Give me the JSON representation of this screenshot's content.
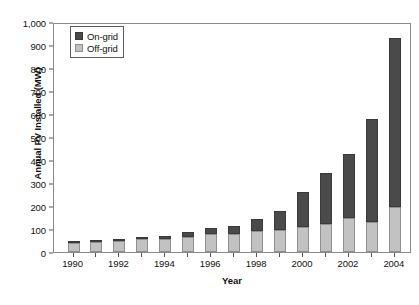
{
  "chart_data": {
    "type": "bar",
    "stacked": true,
    "title": "",
    "xlabel": "Year",
    "ylabel": "Annual PV Installed (MW)",
    "categories": [
      "1990",
      "1991",
      "1992",
      "1993",
      "1994",
      "1995",
      "1996",
      "1997",
      "1998",
      "1999",
      "2000",
      "2001",
      "2002",
      "2003",
      "2004"
    ],
    "x_tick_labels": [
      "1990",
      "1992",
      "1994",
      "1996",
      "1998",
      "2000",
      "2002",
      "2004"
    ],
    "y_tick_labels": [
      "0",
      "100",
      "200",
      "300",
      "400",
      "500",
      "600",
      "700",
      "800",
      "900",
      "1,000"
    ],
    "y_tick_values": [
      0,
      100,
      200,
      300,
      400,
      500,
      600,
      700,
      800,
      900,
      1000
    ],
    "ylim": [
      0,
      1000
    ],
    "grid": false,
    "legend_position": "top-left",
    "series": [
      {
        "name": "Off-grid",
        "color": "#c2c2c2",
        "values": [
          40,
          45,
          50,
          55,
          58,
          65,
          78,
          80,
          90,
          95,
          107,
          120,
          148,
          130,
          197
        ]
      },
      {
        "name": "On-grid",
        "color": "#4a4a4a",
        "values": [
          5,
          5,
          5,
          8,
          12,
          20,
          25,
          32,
          52,
          85,
          153,
          222,
          280,
          450,
          733
        ]
      }
    ],
    "totals": [
      45,
      50,
      55,
      63,
      70,
      85,
      103,
      112,
      142,
      180,
      260,
      342,
      428,
      580,
      930
    ],
    "legend": [
      {
        "label": "On-grid",
        "swatch": "on"
      },
      {
        "label": "Off-grid",
        "swatch": "off"
      }
    ]
  },
  "colors": {
    "on_grid": "#4a4a4a",
    "off_grid": "#c2c2c2",
    "axis": "#8a8a8a",
    "text": "#111111",
    "background": "#ffffff"
  }
}
